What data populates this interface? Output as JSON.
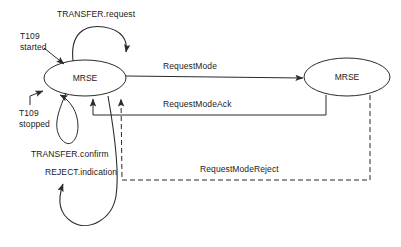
{
  "diagram": {
    "stroke_color": "#2b2b2b",
    "background_color": "#ffffff",
    "states": [
      {
        "id": "state-left",
        "label": "MRSE",
        "cx": 85,
        "cy": 78,
        "rx": 41,
        "ry": 18
      },
      {
        "id": "state-right",
        "label": "MRSE",
        "cx": 347,
        "cy": 77,
        "rx": 43,
        "ry": 19
      }
    ],
    "transitions": [
      {
        "id": "transfer-request",
        "label": "TRANSFER.request",
        "style": "solid",
        "label_x": 57,
        "label_y": 9
      },
      {
        "id": "t109-started",
        "label": "T109\nstarted",
        "line1": "T109",
        "line2": "started",
        "style": "solid",
        "label_x": 20,
        "label_y": 31
      },
      {
        "id": "t109-stopped",
        "label": "T109\nstopped",
        "line1": "T109",
        "line2": "stopped",
        "style": "solid",
        "label_x": 19,
        "label_y": 108
      },
      {
        "id": "request-mode",
        "label": "RequestMode",
        "style": "solid",
        "label_x": 163,
        "label_y": 61
      },
      {
        "id": "request-mode-ack",
        "label": "RequestModeAck",
        "style": "solid",
        "label_x": 163,
        "label_y": 99
      },
      {
        "id": "request-mode-reject",
        "label": "RequestModeReject",
        "style": "dashed",
        "label_x": 200,
        "label_y": 164
      },
      {
        "id": "transfer-confirm",
        "label": "TRANSFER.confirm",
        "style": "solid",
        "label_x": 31,
        "label_y": 149
      },
      {
        "id": "reject-indication",
        "label": "REJECT.indication",
        "style": "solid",
        "label_x": 45,
        "label_y": 167
      }
    ]
  }
}
